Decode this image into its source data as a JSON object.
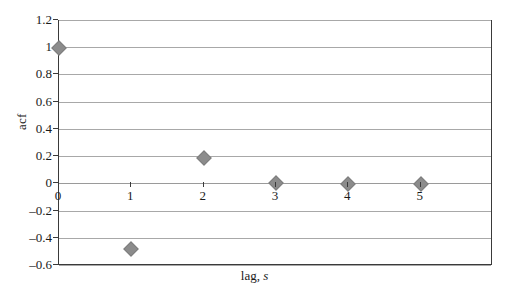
{
  "chart_data": {
    "type": "scatter",
    "title": "",
    "subtitle": "",
    "xlabel": "lag, s",
    "xlabel_plain": "lag, ",
    "xlabel_italic": "s",
    "ylabel": "acf",
    "x": [
      0,
      1,
      2,
      3,
      4,
      5
    ],
    "values": [
      1.0,
      -0.475,
      0.19,
      0.01,
      0.005,
      0.005
    ],
    "series": [
      {
        "name": "acf",
        "marker": "diamond",
        "color": "#8c8c8c",
        "points": [
          {
            "x": 0,
            "y": 1.0
          },
          {
            "x": 1,
            "y": -0.475
          },
          {
            "x": 2,
            "y": 0.19
          },
          {
            "x": 3,
            "y": 0.01
          },
          {
            "x": 4,
            "y": 0.005
          },
          {
            "x": 5,
            "y": 0.005
          }
        ]
      }
    ],
    "xlim": [
      0,
      6
    ],
    "ylim": [
      -0.6,
      1.2
    ],
    "xticks": [
      0,
      1,
      2,
      3,
      4,
      5
    ],
    "xtick_labels": [
      "0",
      "1",
      "2",
      "3",
      "4",
      "5"
    ],
    "yticks": [
      1.2,
      1.0,
      0.8,
      0.6,
      0.4,
      0.2,
      0.0,
      -0.2,
      -0.4,
      -0.6
    ],
    "ytick_labels": [
      "1.2",
      "1",
      "0.8",
      "0.6",
      "0.4",
      "0.2",
      "0",
      "–0.2",
      "–0.4",
      "–0.6"
    ],
    "grid": "horizontal",
    "legend": "none",
    "plot_border": true,
    "colors": {
      "marker": "#8c8c8c",
      "gridline": "#a8a8a8",
      "axis": "#3a3a3a",
      "text": "#1a1a1a",
      "background": "#ffffff"
    }
  }
}
